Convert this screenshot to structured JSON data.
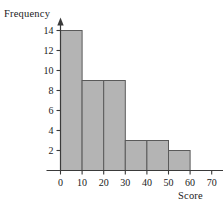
{
  "chart_data": {
    "type": "bar",
    "title": "",
    "xlabel": "Score",
    "ylabel": "Frequency",
    "categories": [
      "0-10",
      "10-20",
      "20-30",
      "30-40",
      "40-50",
      "50-60"
    ],
    "bin_edges": [
      0,
      10,
      20,
      30,
      40,
      50,
      60
    ],
    "values": [
      14,
      9,
      9,
      3,
      3,
      2
    ],
    "xlim": [
      0,
      70
    ],
    "ylim": [
      0,
      15
    ],
    "x_ticks": [
      0,
      10,
      20,
      30,
      40,
      50,
      60,
      70
    ],
    "x_tick_labels": [
      "0",
      "10",
      "20",
      "30",
      "40",
      "50",
      "60",
      "70"
    ],
    "y_ticks": [
      2,
      4,
      6,
      8,
      10,
      12,
      14
    ],
    "y_tick_labels": [
      "2",
      "4",
      "6",
      "8",
      "10",
      "12",
      "14"
    ],
    "grid": false,
    "legend": false,
    "bar_fill_color": "#b4b4b4",
    "bar_edge_color": "#5a5a5a",
    "axis_color": "#3a3a3a",
    "background_color": "#ffffff",
    "axes_have_arrowheads": true
  },
  "axes": {
    "y_title": "Frequency",
    "x_title": "Score"
  }
}
